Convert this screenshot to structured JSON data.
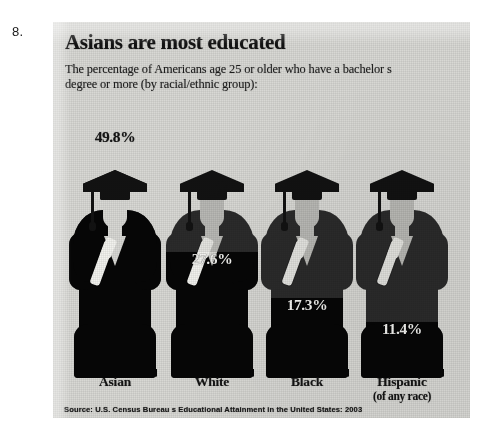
{
  "question_number": "8.",
  "graphic": {
    "headline": "Asians are most educated",
    "subhead": "The percentage of Americans age 25 or older who have a bachelor s degree or more (by racial/ethnic group):",
    "source": "Source: U.S. Census Bureau s Educational Attainment in the United States: 2003",
    "colors": {
      "paper": "#d8d8d4",
      "figure_dark": "#2b2b2b",
      "figure_fill": "#060606",
      "skin": "#b9b9b5",
      "ink": "#121212"
    }
  },
  "chart_data": {
    "type": "bar",
    "title": "Asians are most educated",
    "subtitle": "The percentage of Americans age 25 or older who have a bachelor s degree or more (by racial/ethnic group):",
    "xlabel": "",
    "ylabel": "Percent with a bachelor's degree or more",
    "ylim": [
      0,
      55
    ],
    "grid": false,
    "legend": "none",
    "units": "percent",
    "note": "Pictorial bar chart: each category is a graduate figure filled from the bottom in proportion to its value.",
    "categories": [
      "Asian",
      "White",
      "Black",
      "Hispanic"
    ],
    "category_sublabels": [
      "",
      "",
      "",
      "(of any race)"
    ],
    "values": [
      49.8,
      27.6,
      17.3,
      11.4
    ],
    "value_labels": [
      "49.8%",
      "27.6%",
      "17.3%",
      "11.4%"
    ],
    "label_styles": [
      "dark",
      "light",
      "light",
      "light"
    ],
    "source": "Source: U.S. Census Bureau s Educational Attainment in the United States: 2003"
  },
  "bars": [
    {
      "category": "Asian",
      "sublabel": "",
      "value_label": "49.8%",
      "fill_px": 222,
      "label_bottom_px": 232,
      "style": "dark"
    },
    {
      "category": "White",
      "sublabel": "",
      "value_label": "27.6%",
      "fill_px": 126,
      "label_bottom_px": 110,
      "style": "light"
    },
    {
      "category": "Black",
      "sublabel": "",
      "value_label": "17.3%",
      "fill_px": 80,
      "label_bottom_px": 64,
      "style": "light"
    },
    {
      "category": "Hispanic",
      "sublabel": "(of any race)",
      "value_label": "11.4%",
      "fill_px": 56,
      "label_bottom_px": 40,
      "style": "light"
    }
  ]
}
